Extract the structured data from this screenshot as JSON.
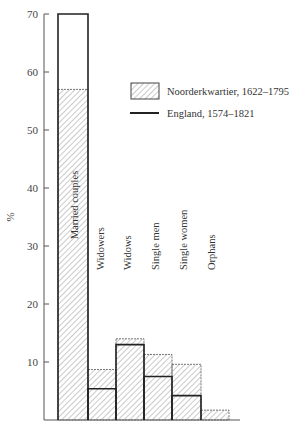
{
  "chart_data": {
    "type": "bar",
    "title": "",
    "xlabel": "",
    "ylabel": "%",
    "ylim": [
      0,
      70
    ],
    "yticks": [
      10,
      20,
      30,
      40,
      50,
      60,
      70
    ],
    "grid": false,
    "legend_position": "upper right",
    "categories": [
      "Married couples",
      "Widowers",
      "Widows",
      "Single men",
      "Single women",
      "Orphans"
    ],
    "series": [
      {
        "name": "Noorderkwartier, 1622–1795",
        "style": "hatched bar",
        "values": [
          57,
          8.7,
          14,
          11.3,
          9.6,
          1.7
        ]
      },
      {
        "name": "England, 1574–1821",
        "style": "solid line",
        "values": [
          70,
          5.4,
          13,
          7.5,
          4.2,
          0
        ]
      }
    ]
  },
  "legend": {
    "items": [
      {
        "label": "Noorderkwartier, 1622–1795"
      },
      {
        "label": "England, 1574–1821"
      }
    ]
  },
  "axis": {
    "ylabel": "%",
    "ticks": [
      "10",
      "20",
      "30",
      "40",
      "50",
      "60",
      "70"
    ]
  },
  "colors": {
    "ink": "#222222",
    "hatch": "#777777",
    "background": "#ffffff"
  }
}
